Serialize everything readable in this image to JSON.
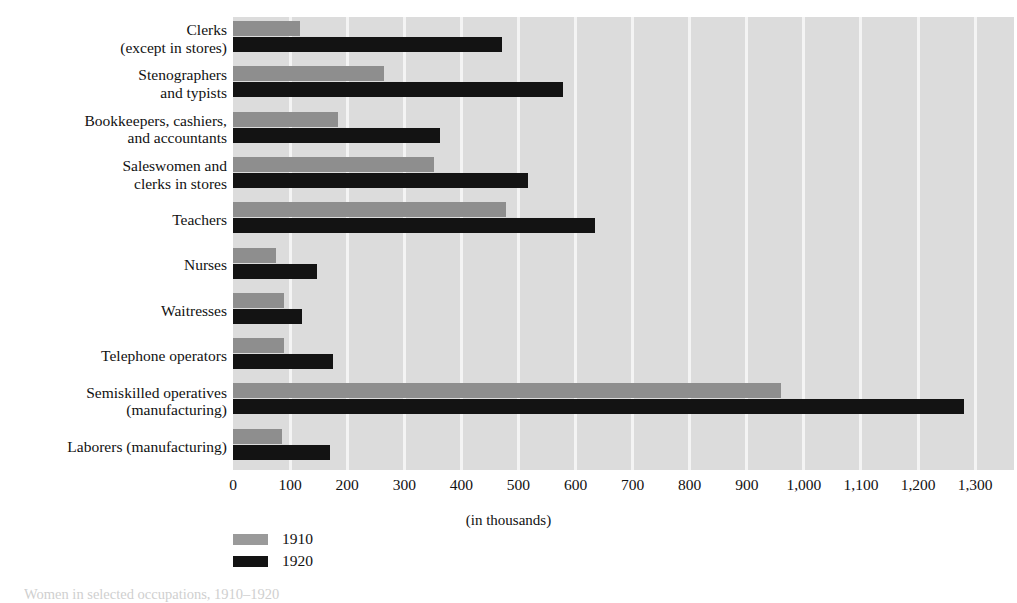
{
  "chart_data": {
    "type": "bar",
    "orientation": "horizontal",
    "title": "",
    "xlabel": "(in thousands)",
    "ylabel": "",
    "xlim": [
      0,
      1368
    ],
    "xticks": [
      "0",
      "100",
      "200",
      "300",
      "400",
      "500",
      "600",
      "700",
      "800",
      "900",
      "1,000",
      "1,100",
      "1,200",
      "1,300"
    ],
    "xtick_values": [
      0,
      100,
      200,
      300,
      400,
      500,
      600,
      700,
      800,
      900,
      1000,
      1100,
      1200,
      1300
    ],
    "grid": true,
    "grid_axis": "x",
    "legend_position": "bottom-left",
    "categories": [
      "Clerks\n(except in stores)",
      "Stenographers\nand typists",
      "Bookkeepers, cashiers,\nand accountants",
      "Saleswomen and\nclerks in stores",
      "Teachers",
      "Nurses",
      "Waitresses",
      "Telephone operators",
      "Semiskilled operatives\n(manufacturing)",
      "Laborers (manufacturing)"
    ],
    "category_lines": [
      [
        "Clerks",
        "(except in stores)"
      ],
      [
        "Stenographers",
        "and typists"
      ],
      [
        "Bookkeepers, cashiers,",
        "and accountants"
      ],
      [
        "Saleswomen and",
        "clerks in stores"
      ],
      [
        "Teachers"
      ],
      [
        "Nurses"
      ],
      [
        "Waitresses"
      ],
      [
        "Telephone operators"
      ],
      [
        "Semiskilled operatives",
        "(manufacturing)"
      ],
      [
        "Laborers (manufacturing)"
      ]
    ],
    "series": [
      {
        "name": "1910",
        "color": "#8e8e8e",
        "values": [
          117,
          265,
          184,
          352,
          478,
          75,
          89,
          89,
          960,
          86
        ]
      },
      {
        "name": "1920",
        "color": "#131313",
        "values": [
          471,
          578,
          363,
          517,
          634,
          147,
          121,
          175,
          1280,
          170
        ]
      }
    ]
  },
  "legend": {
    "items": [
      {
        "label": "1910",
        "swatch": "gray-swatch"
      },
      {
        "label": "1920",
        "swatch": "black-swatch"
      }
    ]
  },
  "caption": {
    "text": "Women in selected occupations, 1910–1920"
  },
  "colors": {
    "plot_background": "#dcdcdc",
    "gridline": "#f4f4f4",
    "series_1910": "#8e8e8e",
    "series_1920": "#131313",
    "page_background": "#ffffff",
    "text": "#111111"
  }
}
